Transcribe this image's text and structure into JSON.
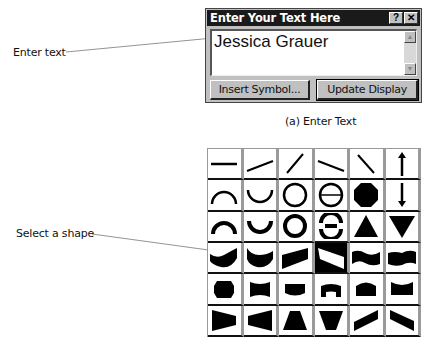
{
  "callouts": {
    "enter_text": "Enter text",
    "select_shape": "Select a shape"
  },
  "dialog": {
    "title": "Enter Your Text Here",
    "help_button": "?",
    "close_button": "✕",
    "text_value": "Jessica Grauer",
    "scroll_up": "▲",
    "scroll_down": "▼",
    "insert_symbol_label": "Insert Symbol...",
    "update_display_label": "Update Display"
  },
  "caption": "(a) Enter Text",
  "shape_grid": {
    "rows": 6,
    "columns": 6,
    "selected": {
      "row": 4,
      "column": 4
    },
    "shapes": [
      [
        "horizontal-line",
        "shallow-rising-line",
        "steep-rising-line",
        "shallow-falling-line",
        "steep-falling-line",
        "up-arrow-line"
      ],
      [
        "arc-top",
        "arc-bottom",
        "circle",
        "circle-with-bar",
        "octagon",
        "down-arrow-line"
      ],
      [
        "thick-arc-top",
        "thick-arc-bottom",
        "thick-circle",
        "thick-circle-with-bar",
        "triangle-up",
        "triangle-down"
      ],
      [
        "wave-cup",
        "wave-bowl",
        "wedge-rising",
        "wedge-falling-inverted",
        "wave-band",
        "wave-band-2"
      ],
      [
        "barrel",
        "pinch",
        "bowl-bottom",
        "cup-top",
        "dome-top",
        "cup-top-2"
      ],
      [
        "trapezoid-right",
        "trapezoid-left",
        "trapezoid-up",
        "trapezoid-down",
        "slant-rising",
        "slant-falling"
      ]
    ]
  }
}
